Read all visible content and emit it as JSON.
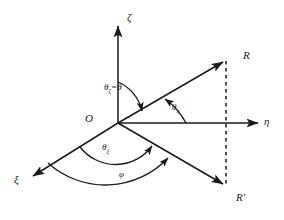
{
  "figure": {
    "background_color": "#ffffff",
    "stroke_color": "#1a1a1a"
  },
  "axes": [
    {
      "name": "zeta-axis",
      "label": "ζ",
      "direction": "up",
      "from": [
        118,
        123
      ],
      "to": [
        118,
        22
      ]
    },
    {
      "name": "eta-axis",
      "label": "η",
      "direction": "right",
      "from": [
        118,
        123
      ],
      "to": [
        262,
        123
      ]
    },
    {
      "name": "xi-axis",
      "label": "ξ",
      "direction": "lower-left",
      "from": [
        118,
        123
      ],
      "to": [
        30,
        178
      ]
    }
  ],
  "vectors": [
    {
      "name": "vector-R",
      "label": "R",
      "from": [
        118,
        123
      ],
      "to": [
        226,
        60
      ]
    },
    {
      "name": "vector-R-prime",
      "label": "R′",
      "from": [
        118,
        123
      ],
      "to": [
        226,
        186
      ]
    }
  ],
  "construction_lines": [
    {
      "name": "dashed-drop-line",
      "style": "dashed",
      "from": [
        226,
        60
      ],
      "to": [
        226,
        186
      ]
    }
  ],
  "origin": {
    "name": "origin",
    "label": "O",
    "position": [
      118,
      123
    ]
  },
  "angles": [
    {
      "name": "angle-theta-zeta",
      "label": "θ",
      "subscript": "ζ",
      "suffix": "=θ",
      "between": [
        "zeta-axis",
        "vector-R"
      ]
    },
    {
      "name": "angle-theta-eta",
      "label": "θ",
      "subscript": "η",
      "suffix": "",
      "between": [
        "eta-axis",
        "vector-R"
      ]
    },
    {
      "name": "angle-theta-xi",
      "label": "θ",
      "subscript": "ξ",
      "suffix": "",
      "between": [
        "xi-axis",
        "vector-R-prime"
      ]
    },
    {
      "name": "angle-phi",
      "label": "φ",
      "subscript": "",
      "suffix": "",
      "between": [
        "xi-axis",
        "vector-R-prime"
      ]
    }
  ],
  "labels": {
    "zeta": "ζ",
    "eta": "η",
    "xi": "ξ",
    "origin": "O",
    "R": "R",
    "R_prime": "R′",
    "theta": "θ",
    "sub_zeta": "ζ",
    "sub_eta": "η",
    "sub_xi": "ξ",
    "theta_zeta_suffix": "=θ",
    "phi": "φ"
  }
}
